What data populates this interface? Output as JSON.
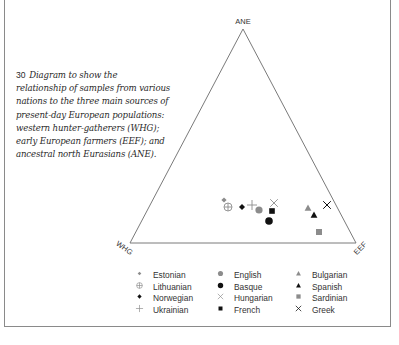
{
  "caption": {
    "number": "30",
    "text": "Diagram to show the relationship of samples from various nations to the three main sources of present-day European populations: western hunter-gatherers (WHG); early European farmers (EEF); and ancestral north Eurasians (ANE).",
    "lines": [
      "Diagram to show the",
      "relationship of samples from various",
      "nations to the three main sources of",
      "present-day European populations:",
      "western hunter-gatherers (WHG);",
      "early European farmers (EEF); and",
      "ancestral north Eurasians (ANE)."
    ]
  },
  "vertices": {
    "top": "ANE",
    "left": "WHG",
    "right": "EEF"
  },
  "colors": {
    "line": "#7a7a7a",
    "gray_marker": "#8c8c8c",
    "black_marker": "#111111",
    "text": "#333333"
  },
  "legend": {
    "columns": [
      [
        {
          "label": "Estonian",
          "marker": "small-diamond-gray"
        },
        {
          "label": "Lithuanian",
          "marker": "circle-plus-open"
        },
        {
          "label": "Norwegian",
          "marker": "diamond-black"
        },
        {
          "label": "Ukrainian",
          "marker": "plus-gray"
        }
      ],
      [
        {
          "label": "English",
          "marker": "circle-gray"
        },
        {
          "label": "Basque",
          "marker": "circle-black"
        },
        {
          "label": "Hungarian",
          "marker": "x-gray"
        },
        {
          "label": "French",
          "marker": "square-black"
        }
      ],
      [
        {
          "label": "Bulgarian",
          "marker": "triangle-gray"
        },
        {
          "label": "Spanish",
          "marker": "triangle-black"
        },
        {
          "label": "Sardinian",
          "marker": "square-gray"
        },
        {
          "label": "Greek",
          "marker": "x-black"
        }
      ]
    ]
  },
  "chart_data": {
    "type": "scatter",
    "subtype": "ternary",
    "title": "Diagram to show the relationship of samples from various nations to the three main sources of present-day European populations",
    "axes": [
      "WHG",
      "EEF",
      "ANE"
    ],
    "axis_labels": {
      "WHG": "western hunter-gatherers",
      "EEF": "early European farmers",
      "ANE": "ancestral north Eurasians"
    },
    "note": "Approximate ternary proportions estimated from marker positions (WHG, EEF, ANE)",
    "points": [
      {
        "name": "Estonian",
        "marker": "small-diamond-gray",
        "WHG": 0.52,
        "EEF": 0.28,
        "ANE": 0.2
      },
      {
        "name": "Lithuanian",
        "marker": "circle-plus-open",
        "WHG": 0.52,
        "EEF": 0.31,
        "ANE": 0.17
      },
      {
        "name": "Norwegian",
        "marker": "diamond-black",
        "WHG": 0.46,
        "EEF": 0.37,
        "ANE": 0.17
      },
      {
        "name": "Ukrainian",
        "marker": "plus-gray",
        "WHG": 0.42,
        "EEF": 0.4,
        "ANE": 0.18
      },
      {
        "name": "English",
        "marker": "circle-gray",
        "WHG": 0.4,
        "EEF": 0.44,
        "ANE": 0.16
      },
      {
        "name": "Basque",
        "marker": "circle-black",
        "WHG": 0.39,
        "EEF": 0.51,
        "ANE": 0.1
      },
      {
        "name": "Hungarian",
        "marker": "x-gray",
        "WHG": 0.32,
        "EEF": 0.48,
        "ANE": 0.2
      },
      {
        "name": "French",
        "marker": "square-black",
        "WHG": 0.35,
        "EEF": 0.49,
        "ANE": 0.16
      },
      {
        "name": "Bulgarian",
        "marker": "triangle-gray",
        "WHG": 0.19,
        "EEF": 0.64,
        "ANE": 0.17
      },
      {
        "name": "Spanish",
        "marker": "triangle-black",
        "WHG": 0.19,
        "EEF": 0.68,
        "ANE": 0.13
      },
      {
        "name": "Sardinian",
        "marker": "square-gray",
        "WHG": 0.15,
        "EEF": 0.77,
        "ANE": 0.08
      },
      {
        "name": "Greek",
        "marker": "x-black",
        "WHG": 0.11,
        "EEF": 0.7,
        "ANE": 0.19
      }
    ],
    "legend_position": "bottom",
    "grid": false
  },
  "plot_positions": [
    {
      "name": "Estonian",
      "marker": "small-diamond-gray",
      "x": 224,
      "y": 200
    },
    {
      "name": "Lithuanian",
      "marker": "circle-plus-open",
      "x": 228,
      "y": 207
    },
    {
      "name": "Norwegian",
      "marker": "diamond-black",
      "x": 242,
      "y": 207
    },
    {
      "name": "Ukrainian",
      "marker": "plus-gray",
      "x": 252,
      "y": 205
    },
    {
      "name": "English",
      "marker": "circle-gray",
      "x": 259,
      "y": 210
    },
    {
      "name": "Basque",
      "marker": "circle-black",
      "x": 269,
      "y": 221
    },
    {
      "name": "Hungarian",
      "marker": "x-gray",
      "x": 274,
      "y": 203
    },
    {
      "name": "French",
      "marker": "square-black",
      "x": 272,
      "y": 211
    },
    {
      "name": "Bulgarian",
      "marker": "triangle-gray",
      "x": 308,
      "y": 208
    },
    {
      "name": "Spanish",
      "marker": "triangle-black",
      "x": 314,
      "y": 215
    },
    {
      "name": "Sardinian",
      "marker": "square-gray",
      "x": 319,
      "y": 232
    },
    {
      "name": "Greek",
      "marker": "x-black",
      "x": 327,
      "y": 205
    }
  ]
}
